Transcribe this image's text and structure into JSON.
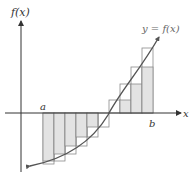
{
  "diagram": {
    "y_axis_label": "f(x)",
    "x_axis_label": "x",
    "curve_label": "y = f(x)",
    "left_endpoint_label": "a",
    "right_endpoint_label": "b",
    "colors": {
      "axis": "#333333",
      "curve": "#555555",
      "fill": "#e3e3e3",
      "outline": "#8a8a8a",
      "background": "#ffffff"
    },
    "subintervals": 10,
    "axes_origin_px": [
      21,
      113
    ],
    "a_px": 43,
    "b_px": 153,
    "rectangles": [
      {
        "x": 43,
        "w": 11,
        "inner": 48,
        "outer": 51
      },
      {
        "x": 54,
        "w": 11,
        "inner": 41,
        "outer": 48
      },
      {
        "x": 65,
        "w": 11,
        "inner": 33,
        "outer": 41
      },
      {
        "x": 76,
        "w": 11,
        "inner": 24,
        "outer": 33
      },
      {
        "x": 87,
        "w": 11,
        "inner": 14,
        "outer": 24
      },
      {
        "x": 98,
        "w": 11,
        "inner": 0,
        "outer": 14
      },
      {
        "x": 109,
        "w": 11,
        "inner": 0,
        "outer": -13
      },
      {
        "x": 120,
        "w": 11,
        "inner": -13,
        "outer": -29
      },
      {
        "x": 131,
        "w": 11,
        "inner": -29,
        "outer": -46
      },
      {
        "x": 142,
        "w": 11,
        "inner": -46,
        "outer": -65
      }
    ]
  }
}
